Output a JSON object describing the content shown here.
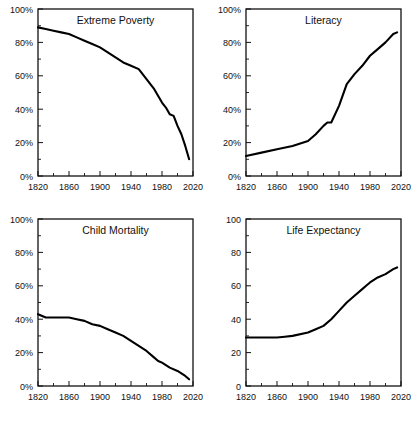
{
  "figure": {
    "layout": "2x2 grid of line charts",
    "background": "#ffffff",
    "line_color": "#000000"
  },
  "chart_data": [
    {
      "type": "line",
      "title": "Extreme Poverty",
      "xlabel": "",
      "ylabel": "",
      "xlim": [
        1820,
        2020
      ],
      "ylim": [
        0,
        100
      ],
      "xticks": [
        1820,
        1860,
        1900,
        1940,
        1980,
        2020
      ],
      "xticklabels": [
        "1820",
        "1860",
        "1900",
        "1940",
        "1980",
        "2020"
      ],
      "yticks": [
        0,
        20,
        40,
        60,
        80,
        100
      ],
      "yticklabels": [
        "0%",
        "20%",
        "40%",
        "60%",
        "80%",
        "100%"
      ],
      "minor_xticks": [
        1840,
        1880,
        1920,
        1960,
        2000
      ],
      "minor_yticks": [
        10,
        30,
        50,
        70,
        90
      ],
      "grid": false,
      "legend": "none",
      "x": [
        1820,
        1830,
        1840,
        1850,
        1860,
        1870,
        1880,
        1890,
        1900,
        1910,
        1920,
        1930,
        1940,
        1950,
        1960,
        1970,
        1980,
        1985,
        1990,
        1995,
        2000,
        2005,
        2010,
        2015
      ],
      "values": [
        89,
        88,
        87,
        86,
        85,
        83,
        81,
        79,
        77,
        74,
        71,
        68,
        66,
        64,
        58,
        52,
        44,
        41,
        37,
        36,
        30,
        25,
        18,
        10
      ]
    },
    {
      "type": "line",
      "title": "Literacy",
      "xlabel": "",
      "ylabel": "",
      "xlim": [
        1820,
        2020
      ],
      "ylim": [
        0,
        100
      ],
      "xticks": [
        1820,
        1860,
        1900,
        1940,
        1980,
        2020
      ],
      "xticklabels": [
        "1820",
        "1860",
        "1900",
        "1940",
        "1980",
        "2020"
      ],
      "yticks": [
        0,
        20,
        40,
        60,
        80,
        100
      ],
      "yticklabels": [
        "0%",
        "20%",
        "40%",
        "60%",
        "80%",
        "100%"
      ],
      "minor_xticks": [
        1840,
        1880,
        1920,
        1960,
        2000
      ],
      "minor_yticks": [
        10,
        30,
        50,
        70,
        90
      ],
      "grid": false,
      "legend": "none",
      "x": [
        1820,
        1840,
        1860,
        1880,
        1900,
        1910,
        1920,
        1925,
        1930,
        1940,
        1950,
        1960,
        1970,
        1980,
        1990,
        2000,
        2010,
        2015
      ],
      "values": [
        12,
        14,
        16,
        18,
        21,
        25,
        30,
        32,
        32,
        42,
        55,
        61,
        66,
        72,
        76,
        80,
        85,
        86
      ]
    },
    {
      "type": "line",
      "title": "Child Mortality",
      "xlabel": "",
      "ylabel": "",
      "xlim": [
        1820,
        2020
      ],
      "ylim": [
        0,
        100
      ],
      "xticks": [
        1820,
        1860,
        1900,
        1940,
        1980,
        2020
      ],
      "xticklabels": [
        "1820",
        "1860",
        "1900",
        "1940",
        "1980",
        "2020"
      ],
      "yticks": [
        0,
        20,
        40,
        60,
        80,
        100
      ],
      "yticklabels": [
        "0%",
        "20%",
        "40%",
        "60%",
        "80%",
        "100%"
      ],
      "minor_xticks": [
        1840,
        1880,
        1920,
        1960,
        2000
      ],
      "minor_yticks": [
        10,
        30,
        50,
        70,
        90
      ],
      "grid": false,
      "legend": "none",
      "x": [
        1820,
        1830,
        1840,
        1850,
        1860,
        1870,
        1880,
        1890,
        1900,
        1910,
        1920,
        1930,
        1940,
        1950,
        1960,
        1970,
        1975,
        1980,
        1990,
        2000,
        2010,
        2015
      ],
      "values": [
        43,
        41,
        41,
        41,
        41,
        40,
        39,
        37,
        36,
        34,
        32,
        30,
        27,
        24,
        21,
        17,
        15,
        14,
        11,
        9,
        6,
        4
      ]
    },
    {
      "type": "line",
      "title": "Life Expectancy",
      "xlabel": "",
      "ylabel": "",
      "xlim": [
        1820,
        2020
      ],
      "ylim": [
        0,
        100
      ],
      "xticks": [
        1820,
        1860,
        1900,
        1940,
        1980,
        2020
      ],
      "xticklabels": [
        "1820",
        "1860",
        "1900",
        "1940",
        "1980",
        "2020"
      ],
      "yticks": [
        0,
        20,
        40,
        60,
        80,
        100
      ],
      "yticklabels": [
        "0",
        "20",
        "40",
        "60",
        "80",
        "100"
      ],
      "minor_xticks": [
        1840,
        1880,
        1920,
        1960,
        2000
      ],
      "minor_yticks": [
        10,
        30,
        50,
        70,
        90
      ],
      "grid": false,
      "legend": "none",
      "x": [
        1820,
        1840,
        1860,
        1870,
        1880,
        1900,
        1910,
        1920,
        1930,
        1940,
        1950,
        1960,
        1970,
        1975,
        1980,
        1990,
        2000,
        2010,
        2015
      ],
      "values": [
        29,
        29,
        29,
        29.5,
        30,
        32,
        34,
        36,
        40,
        45,
        50,
        54,
        58,
        60,
        62,
        65,
        67,
        70,
        71
      ]
    }
  ]
}
